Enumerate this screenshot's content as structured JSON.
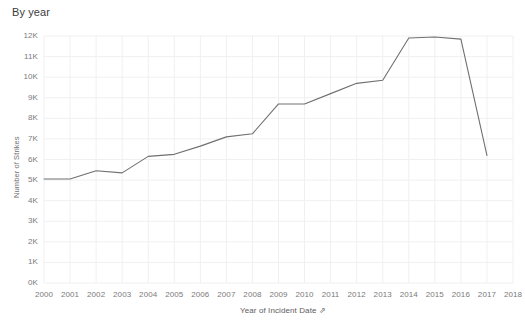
{
  "header": {
    "title": "By year"
  },
  "axis_label_sort_glyph": "⇗",
  "chart_data": {
    "type": "line",
    "title": "By year",
    "xlabel": "Year of Incident Date",
    "ylabel": "Number of Strikes",
    "x": [
      2000,
      2001,
      2002,
      2003,
      2004,
      2005,
      2006,
      2007,
      2008,
      2009,
      2010,
      2011,
      2012,
      2013,
      2014,
      2015,
      2016,
      2017
    ],
    "values": [
      5050,
      5050,
      5450,
      5350,
      6150,
      6250,
      6650,
      7100,
      7250,
      8700,
      8700,
      9200,
      9700,
      9850,
      11900,
      11950,
      11850,
      6200
    ],
    "xtick_labels": [
      "2000",
      "2001",
      "2002",
      "2003",
      "2004",
      "2005",
      "2006",
      "2007",
      "2008",
      "2009",
      "2010",
      "2011",
      "2012",
      "2013",
      "2014",
      "2015",
      "2016",
      "2017",
      "2018"
    ],
    "xticks": [
      2000,
      2001,
      2002,
      2003,
      2004,
      2005,
      2006,
      2007,
      2008,
      2009,
      2010,
      2011,
      2012,
      2013,
      2014,
      2015,
      2016,
      2017,
      2018
    ],
    "ytick_labels": [
      "0K",
      "1K",
      "2K",
      "3K",
      "4K",
      "5K",
      "6K",
      "7K",
      "8K",
      "9K",
      "10K",
      "11K",
      "12K"
    ],
    "yticks": [
      0,
      1000,
      2000,
      3000,
      4000,
      5000,
      6000,
      7000,
      8000,
      9000,
      10000,
      11000,
      12000
    ],
    "xlim": [
      2000,
      2018
    ],
    "ylim": [
      0,
      12000
    ],
    "grid": true,
    "legend": "none",
    "line_color": "#707070",
    "grid_color": "#f0f0f2",
    "background_color": "#ffffff"
  }
}
